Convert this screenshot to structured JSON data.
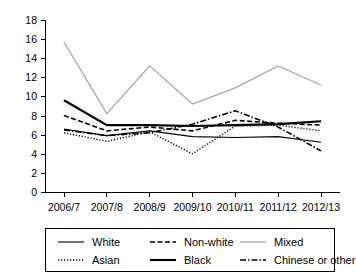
{
  "chart_data": {
    "type": "line",
    "title": "",
    "xlabel": "",
    "ylabel": "",
    "ylim": [
      0,
      18
    ],
    "ytick_step": 2,
    "grid": false,
    "legend_position": "bottom",
    "categories": [
      "2006/7",
      "2007/8",
      "2008/9",
      "2009/10",
      "2010/11",
      "2011/12",
      "2012/13"
    ],
    "ytick_labels": [
      "0",
      "2",
      "4",
      "6",
      "8",
      "10",
      "12",
      "14",
      "16",
      "18"
    ],
    "series": [
      {
        "name": "White",
        "style": "solid-thin",
        "color": "#000000",
        "values": [
          6.6,
          5.9,
          6.4,
          5.8,
          5.7,
          5.8,
          5.2
        ]
      },
      {
        "name": "Non-white",
        "style": "dashed",
        "color": "#000000",
        "values": [
          8.0,
          6.4,
          6.8,
          6.4,
          7.5,
          7.2,
          7.0
        ]
      },
      {
        "name": "Mixed",
        "style": "solid-light",
        "color": "#a8a8a8",
        "values": [
          15.7,
          8.2,
          13.2,
          9.2,
          10.9,
          13.2,
          11.2
        ]
      },
      {
        "name": "Asian",
        "style": "dotted",
        "color": "#000000",
        "values": [
          6.2,
          5.3,
          6.3,
          4.0,
          6.9,
          7.0,
          6.4
        ]
      },
      {
        "name": "Black",
        "style": "solid-thick",
        "color": "#000000",
        "values": [
          9.6,
          7.0,
          7.0,
          6.9,
          7.0,
          7.1,
          7.4
        ]
      },
      {
        "name": "Chinese or other",
        "style": "dash-dot",
        "color": "#000000",
        "values": [
          6.5,
          5.9,
          6.2,
          7.1,
          8.5,
          6.8,
          4.3
        ]
      }
    ]
  },
  "legend": {
    "entries": [
      {
        "label": "White"
      },
      {
        "label": "Non-white"
      },
      {
        "label": "Mixed"
      },
      {
        "label": "Asian"
      },
      {
        "label": "Black"
      },
      {
        "label": "Chinese or other"
      }
    ]
  }
}
